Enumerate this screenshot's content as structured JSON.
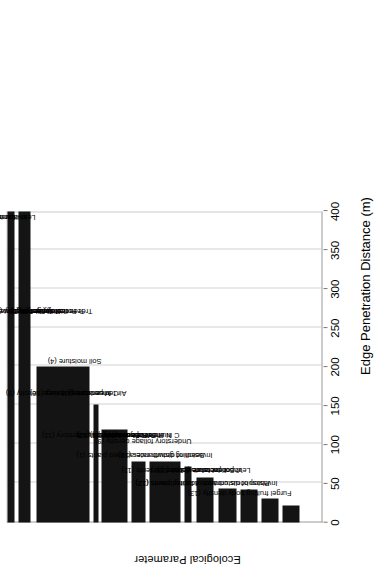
{
  "chart_data": {
    "type": "bar",
    "title": "",
    "xlabel": "Ecological Parameter",
    "ylabel": "Edge Penetration Distance (m)",
    "orientation": "vertical-bars-rotated-figure",
    "value_axis_label": "Edge Penetration Distance (m)",
    "category_axis_label": "Ecological Parameter",
    "ylim": [
      0,
      400
    ],
    "yticks": [
      0,
      50,
      100,
      150,
      200,
      250,
      300,
      350,
      400
    ],
    "grid": "value-axis-only",
    "legend": "none",
    "bar_color": "#141414",
    "categories": [
      "Invasion of disturbance-adapted butterflies (1)",
      "Invasion of disturbance-adapted beedes (2)",
      "Leaf-litter invertebrate species composition (2)",
      "Leaf-litter invertebrate abundance and species richness (3)",
      "Height of greatest foliage density (4)",
      "Relative humidity (1)",
      "Canopy height (5)",
      "Forest dynamics (6)",
      "Tree recruitment (7)",
      "Tree mortality (8)",
      "Soil moisture (4)",
      "Mean canopy foliage density (9)",
      "C in understory leaves (10)",
      "Air temperature (11)",
      "Bird density (1)",
      "Rate of upper fall (12)",
      "PAR penetration to understory (11)",
      "Relative humidity (10)",
      "Number of tree-fall gaps (10)",
      "C in understory str (10)",
      "Understory foliage density (9)",
      "Seedling growth rates (12)",
      "Invasion of disturbance-adaped plants (1)",
      "Leaf relative  water  contents (11)",
      "Soil moisture content (11)",
      "Vapor pressure deficit (11)",
      "Leaf conductance (11)",
      "Phosphorus content of falling leaves (12)",
      "Invasion of disturbance-adapted plants (12)",
      "Furgel fruiting body density (13)"
    ],
    "values": [
      400,
      400,
      400,
      270,
      200,
      200,
      200,
      200,
      200,
      200,
      150,
      130,
      130,
      130,
      100,
      100,
      100,
      100,
      100,
      100,
      60,
      60,
      60,
      40,
      40,
      40,
      40,
      30,
      25,
      20
    ],
    "bar_geometry": [
      {
        "label_index": 0,
        "left_px": 1,
        "width_px": 7,
        "value": 400
      },
      {
        "label_index": 1,
        "left_px": 12,
        "width_px": 12,
        "value": 400
      },
      {
        "label_index": 3,
        "left_px": 30,
        "width_px": 53,
        "value": 200
      },
      {
        "label_index": 10,
        "left_px": 87,
        "width_px": 5,
        "value": 152
      },
      {
        "label_index": 11,
        "left_px": 95,
        "width_px": 26,
        "value": 120
      },
      {
        "label_index": 14,
        "left_px": 125,
        "width_px": 14,
        "value": 78
      },
      {
        "label_index": 17,
        "left_px": 143,
        "width_px": 31,
        "value": 78
      },
      {
        "label_index": 20,
        "left_px": 178,
        "width_px": 7,
        "value": 72
      },
      {
        "label_index": 21,
        "left_px": 190,
        "width_px": 17,
        "value": 58
      },
      {
        "label_index": 23,
        "left_px": 212,
        "width_px": 18,
        "value": 44
      },
      {
        "label_index": 25,
        "left_px": 234,
        "width_px": 17,
        "value": 42
      },
      {
        "label_index": 27,
        "left_px": 255,
        "width_px": 17,
        "value": 31
      },
      {
        "label_index": 29,
        "left_px": 276,
        "width_px": 17,
        "value": 22
      }
    ]
  },
  "axes": {
    "value_title": "Edge Penetration Distance (m)",
    "category_title": "Ecological Parameter",
    "ticks": [
      "0",
      "50",
      "100",
      "150",
      "200",
      "250",
      "300",
      "350",
      "400"
    ]
  },
  "bar_labels": [
    {
      "text": "Invasion of disturbance-adapted butterflies (1)",
      "x": 2,
      "y": 302
    },
    {
      "text": "Invasion of disturbance-adapted beedes (2)",
      "x": 14,
      "y": 302
    },
    {
      "text": "Leaf-litter invertebrate species composition (2)",
      "x": 22,
      "y": 302
    },
    {
      "text": "Leaf-litter invertebrate abundance and species richness (3)",
      "x": 31,
      "y": 208
    },
    {
      "text": "Height of greatest foliage density (4)",
      "x": 39,
      "y": 208
    },
    {
      "text": "Relative humidity (1)",
      "x": 47,
      "y": 208
    },
    {
      "text": "Canopy height (5)",
      "x": 55,
      "y": 208
    },
    {
      "text": "Forest dynamics (6)",
      "x": 63,
      "y": 208
    },
    {
      "text": "Tree recruitment (7)",
      "x": 71,
      "y": 208
    },
    {
      "text": "Tree mortality (8)",
      "x": 79,
      "y": 208
    },
    {
      "text": "Soil moisture (4)",
      "x": 88,
      "y": 158
    },
    {
      "text": "Mean canopy foliage density (9)",
      "x": 97,
      "y": 126
    },
    {
      "text": "C in understory leaves (10)",
      "x": 105,
      "y": 126
    },
    {
      "text": "Air temperature (11)",
      "x": 113,
      "y": 126
    },
    {
      "text": "Bird density (1)",
      "x": 126,
      "y": 84
    },
    {
      "text": "Rate of upper fall (12)",
      "x": 134,
      "y": 84
    },
    {
      "text": "PAR penetration to understory (11)",
      "x": 142,
      "y": 84
    },
    {
      "text": "Relative humidity (10)",
      "x": 150,
      "y": 84
    },
    {
      "text": "Number of tree-fall gaps (10)",
      "x": 158,
      "y": 84
    },
    {
      "text": "C in understory str (10)",
      "x": 166,
      "y": 84
    },
    {
      "text": "Understory foliage density (9)",
      "x": 178,
      "y": 78
    },
    {
      "text": "Seedling growth rates (12)",
      "x": 191,
      "y": 64
    },
    {
      "text": "Invasion of disturbance-adaped plants (1)",
      "x": 199,
      "y": 64
    },
    {
      "text": "Leaf relative  water  contents (11)",
      "x": 213,
      "y": 49
    },
    {
      "text": "Soil moisture content (11)",
      "x": 221,
      "y": 49
    },
    {
      "text": "Vapor pressure deficit (11)",
      "x": 229,
      "y": 49
    },
    {
      "text": "Leaf conductance (11)",
      "x": 237,
      "y": 49
    },
    {
      "text": "Phosphorus content of falling leaves (12)",
      "x": 256,
      "y": 36
    },
    {
      "text": "Invasion of disturbance-adapted plants (12)",
      "x": 264,
      "y": 36
    },
    {
      "text": "Furgel fruiting body density (13)",
      "x": 278,
      "y": 26
    }
  ]
}
